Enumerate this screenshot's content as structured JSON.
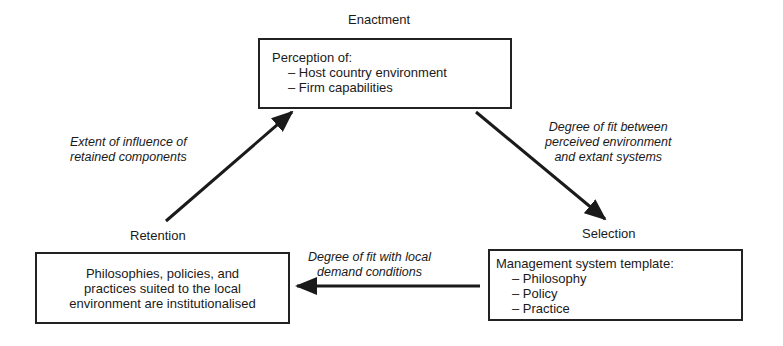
{
  "stages": {
    "enactment": {
      "label": "Enactment",
      "box": {
        "heading": "Perception of:",
        "items": [
          "Host country environment",
          "Firm capabilities"
        ]
      }
    },
    "selection": {
      "label": "Selection",
      "box": {
        "heading": "Management system template:",
        "items": [
          "Philosophy",
          "Policy",
          "Practice"
        ]
      }
    },
    "retention": {
      "label": "Retention",
      "box": {
        "lines": [
          "Philosophies, policies, and",
          "practices suited to the local",
          "environment are institutionalised"
        ]
      }
    }
  },
  "edges": {
    "enactment_to_selection": {
      "lines": [
        "Degree of fit between",
        "perceived environment",
        "and  extant systems"
      ]
    },
    "selection_to_retention": {
      "lines": [
        "Degree of fit with local",
        "demand conditions"
      ]
    },
    "retention_to_enactment": {
      "lines": [
        "Extent of influence of",
        "retained components"
      ]
    }
  },
  "colors": {
    "ink": "#1a1a1a",
    "background": "#ffffff"
  }
}
